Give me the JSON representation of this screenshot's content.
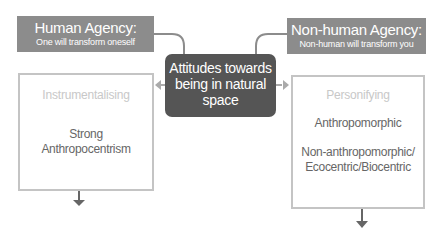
{
  "diagram": {
    "center": {
      "lines": [
        "Attitudes towards",
        "being in natural",
        "space"
      ]
    },
    "human_agency": {
      "title": "Human Agency:",
      "subtitle": "One will transform oneself"
    },
    "nonhuman_agency": {
      "title": "Non-human Agency:",
      "subtitle": "Non-human will transform you"
    },
    "left_box": {
      "category": "Instrumentalising",
      "attitudes": [
        {
          "lines": [
            "Strong",
            "Anthropocentrism"
          ]
        }
      ]
    },
    "right_box": {
      "category": "Personifying",
      "attitudes": [
        {
          "lines": [
            "Anthropomorphic"
          ]
        },
        {
          "lines": [
            "Non-anthropomorphic/",
            "Ecocentric/Biocentric"
          ]
        }
      ]
    },
    "colors": {
      "agency_box": "#8c8c8c",
      "center_box": "#555555",
      "content_border": "#c4c4c4",
      "category_text": "#c8c8c8",
      "attitude_text": "#666666",
      "connector": "#8c8c8c"
    }
  }
}
